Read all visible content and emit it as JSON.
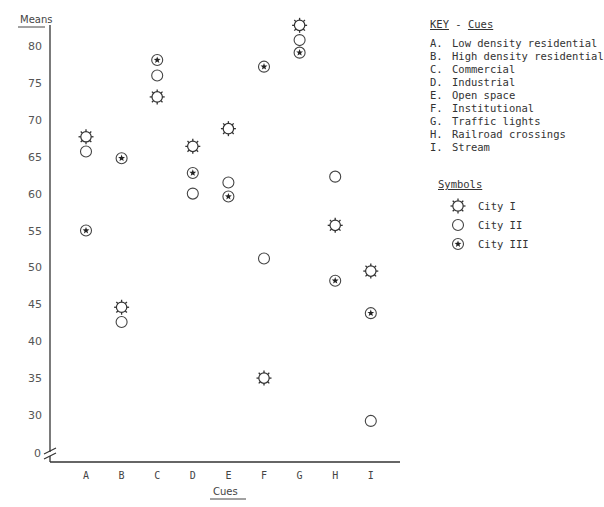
{
  "chart_data": {
    "type": "scatter",
    "title": "",
    "xlabel": "Cues",
    "ylabel": "Means",
    "categories": [
      "A",
      "B",
      "C",
      "D",
      "E",
      "F",
      "G",
      "H",
      "I"
    ],
    "yticks": [
      80,
      75,
      70,
      65,
      60,
      55,
      50,
      45,
      40,
      35,
      30
    ],
    "y_zero_label": "0",
    "y_axis_break": true,
    "ylim": [
      28,
      83
    ],
    "grid": false,
    "legend_position": "right",
    "series": [
      {
        "name": "City I",
        "marker": "sun",
        "values": [
          67.7,
          44.6,
          73.1,
          66.4,
          68.8,
          35.0,
          82.8,
          55.7,
          49.5
        ]
      },
      {
        "name": "City II",
        "marker": "circle",
        "values": [
          65.7,
          42.6,
          76.0,
          60.0,
          61.5,
          51.2,
          80.8,
          62.3,
          29.2
        ]
      },
      {
        "name": "City III",
        "marker": "star-circle",
        "values": [
          55.0,
          64.8,
          78.1,
          62.8,
          59.6,
          77.2,
          79.1,
          48.2,
          43.8
        ]
      }
    ]
  },
  "key": {
    "title_a": "KEY",
    "title_sep": " - ",
    "title_b": "Cues",
    "items": [
      {
        "letter": "A.",
        "label": "Low density residential"
      },
      {
        "letter": "B.",
        "label": "High density residential"
      },
      {
        "letter": "C.",
        "label": "Commercial"
      },
      {
        "letter": "D.",
        "label": "Industrial"
      },
      {
        "letter": "E.",
        "label": "Open space"
      },
      {
        "letter": "F.",
        "label": "Institutional"
      },
      {
        "letter": "G.",
        "label": "Traffic lights"
      },
      {
        "letter": "H.",
        "label": "Railroad crossings"
      },
      {
        "letter": "I.",
        "label": "Stream"
      }
    ]
  },
  "symbols": {
    "title": "Symbols",
    "items": [
      {
        "icon": "sun-icon",
        "label": "City I"
      },
      {
        "icon": "circle-icon",
        "label": "City II"
      },
      {
        "icon": "star-circle-icon",
        "label": "City III"
      }
    ]
  }
}
